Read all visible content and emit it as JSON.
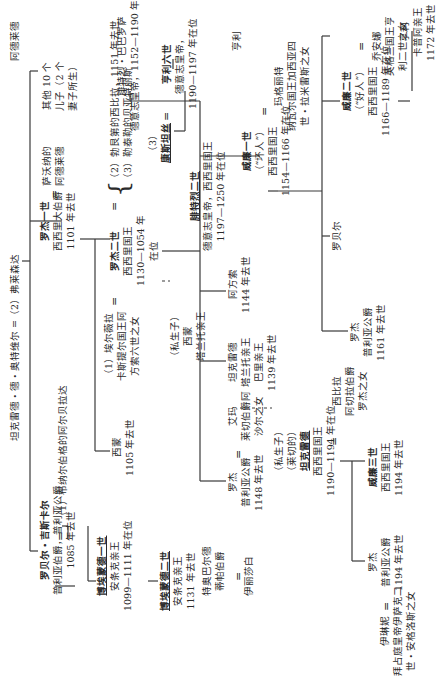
{
  "nodes": {
    "tancred": {
      "line1": "坦克雷德・德・奥特维尔 =（2）弗莱森达"
    },
    "robert_guiscard": {
      "name": "罗贝尔・吉斯卡尔",
      "line2": "普利亚伯爵，普利亚公爵",
      "line3": "1085 年去世"
    },
    "alberada": {
      "line1": "（1）布纳尔伯格的阿尔贝拉达"
    },
    "bohemond1": {
      "name": "博埃蒙德一世",
      "line2": "安条克亲王",
      "line3": "1099—1111 年在位"
    },
    "bohemond2": {
      "name": "博埃蒙德二世",
      "line2": "安条克亲王",
      "line3": "1131 年去世"
    },
    "roger1": {
      "name": "罗杰一世",
      "line2": "西西里大伯爵",
      "line3": "1101 年去世"
    },
    "adelaide": {
      "line1": "萨沃纳的",
      "line2": "阿德莱德"
    },
    "simon": {
      "line1": "西蒙",
      "line2": "1105 年去世"
    },
    "elvira": {
      "line1": "（1）埃尔薇拉",
      "line2": "卡斯提尔国王阿",
      "line3": "方索六世之女"
    },
    "roger2": {
      "name": "罗杰二世",
      "line2": "西西里国王",
      "line3": "1130—1054 年",
      "line4": "在位"
    },
    "wives23": {
      "line1": "（2）勃艮第的西比拉，1151 年去世",
      "line2": "（3）勒泰勒的贝亚特丽斯"
    },
    "other_sons": {
      "line1": "其他 10 个",
      "line2": "儿子（2 个",
      "line3": "妻子所生）"
    },
    "simon_illeg": {
      "line1": "（私生子）",
      "line2": "西蒙",
      "line3": "塔兰托亲王"
    },
    "constance": {
      "line1": "（3）",
      "name": "康斯坦丝"
    },
    "frederick_barbarossa": {
      "line1": "腓特烈・巴巴罗萨",
      "line2": "德意志皇帝，1152—1190 年在位"
    },
    "henry6": {
      "name": "亨利六世",
      "line2": "德意志皇帝，",
      "line3": "1190—1197 年在位"
    },
    "frederick2": {
      "name": "腓特烈二世",
      "line2": "德意志皇帝，西西里国王",
      "line3": "1197—1250 年在位"
    },
    "roger_apulia_1148": {
      "line1": "罗杰",
      "line2": "普利亚公爵",
      "line3": "1148 年去世"
    },
    "emma": {
      "line1": "艾玛",
      "line2": "莱切伯爵阿",
      "line3": "沙尔之女"
    },
    "tancred_taranto": {
      "line1": "坦克雷德",
      "line2": "塔兰托亲王",
      "line3": "巴里亲王",
      "line4": "1139 年去世"
    },
    "alfonso": {
      "line1": "阿方索",
      "line2": "1144 年去世"
    },
    "william1": {
      "name": "威廉一世",
      "line2": "（“坏人”）",
      "line3": "西西里国王",
      "line4": "1154—1166 年在位"
    },
    "roger_1161": {
      "line1": "罗杰",
      "line2": "普利亚公爵",
      "line3": "1161 年去世"
    },
    "robert": {
      "line1": "罗贝尔"
    },
    "henry_top": {
      "line1": "亨利"
    },
    "adelaide2": {
      "line1": "阿德莱德"
    },
    "margaret": {
      "line1": "玛格丽特",
      "line2": "纳瓦尔国王加西亚四",
      "line3": "世・拉米雷斯之女"
    },
    "william2": {
      "name": "威廉二世",
      "line2": "（“好人”）",
      "line3": "西西里国王",
      "line4": "1166—1189 年在位"
    },
    "joanna": {
      "line1": "乔安娜",
      "line2": "英格兰国王亨",
      "line3": "利二世之女"
    },
    "henry_capua": {
      "line1": "亨利",
      "line2": "卡普阿亲王",
      "line3": "1172 年去世"
    },
    "tancred_lecce": {
      "line1": "（私生子）",
      "line2": "（莱切的）",
      "name": "坦克雷德",
      "line4": "西西里国王",
      "line5": "1190—1194 年在位"
    },
    "sibylla": {
      "line1": "西比拉",
      "line2": "阿切拉伯爵",
      "line3": "罗杰之女"
    },
    "william3": {
      "name": "威廉三世",
      "line2": "西西里国王",
      "line3": "1194 年去世"
    },
    "roger_1194": {
      "line1": "罗杰",
      "line2": "普利亚公爵",
      "line3": "1194 年去世"
    },
    "irene": {
      "line1": "伊琳妮",
      "line2": "拜占庭皇帝伊萨克二",
      "line3": "世・安格洛斯之女"
    },
    "theobald": {
      "line1": "特奥巴尔德",
      "line2": "蒂帕伯爵"
    },
    "elizabeth": {
      "line1": "伊丽莎白"
    }
  },
  "symbols": {
    "marriage": "="
  }
}
